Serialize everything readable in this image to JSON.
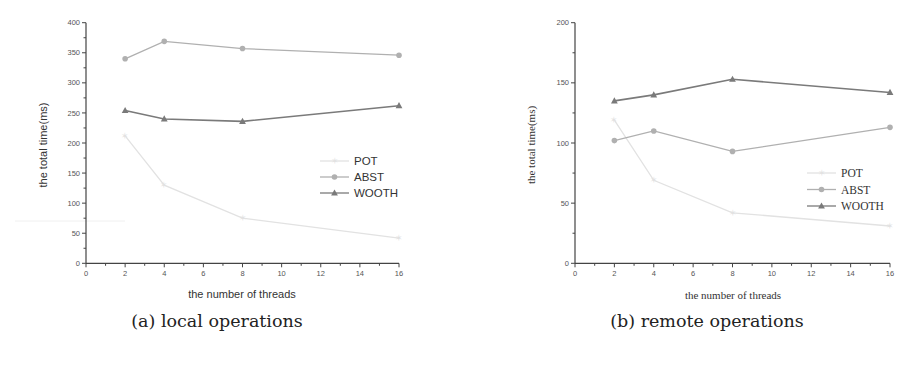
{
  "chart_data": [
    {
      "type": "line",
      "title": "",
      "caption": "(a) local operations",
      "xlabel": "the number of threads",
      "ylabel": "the total time(ms)",
      "x": [
        2,
        4,
        8,
        16
      ],
      "xlim": [
        0,
        16
      ],
      "ylim": [
        0,
        400
      ],
      "xticks": [
        0,
        2,
        4,
        6,
        8,
        10,
        12,
        14,
        16
      ],
      "yticks": [
        0,
        50,
        100,
        150,
        200,
        250,
        300,
        350,
        400
      ],
      "grid": false,
      "legend_position": "right-middle",
      "series": [
        {
          "name": "POT",
          "marker": "star",
          "color": "#e2e2e2",
          "values": [
            212,
            130,
            75,
            42
          ]
        },
        {
          "name": "ABST",
          "marker": "circle",
          "color": "#b0b0b0",
          "values": [
            340,
            369,
            357,
            346
          ]
        },
        {
          "name": "WOOTH",
          "marker": "triangle",
          "color": "#7a7a7a",
          "values": [
            254,
            240,
            236,
            262
          ]
        }
      ]
    },
    {
      "type": "line",
      "title": "",
      "caption": "(b) remote operations",
      "xlabel": "the number of threads",
      "ylabel": "the total time(ms)",
      "x": [
        2,
        4,
        8,
        16
      ],
      "xlim": [
        0,
        16
      ],
      "ylim": [
        0,
        200
      ],
      "xticks": [
        0,
        2,
        4,
        6,
        8,
        10,
        12,
        14,
        16
      ],
      "yticks": [
        0,
        50,
        100,
        150,
        200
      ],
      "grid": false,
      "legend_position": "right-middle",
      "series": [
        {
          "name": "POT",
          "marker": "star",
          "color": "#e2e2e2",
          "values": [
            119,
            69,
            42,
            31
          ]
        },
        {
          "name": "ABST",
          "marker": "circle",
          "color": "#b0b0b0",
          "values": [
            102,
            110,
            93,
            113
          ]
        },
        {
          "name": "WOOTH",
          "marker": "triangle",
          "color": "#7a7a7a",
          "values": [
            135,
            140,
            153,
            142
          ]
        }
      ]
    }
  ]
}
